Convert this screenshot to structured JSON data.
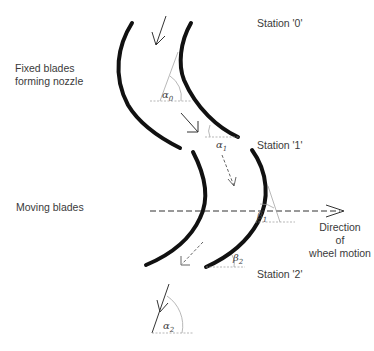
{
  "labels": {
    "fixed_blades_line1": "Fixed blades",
    "fixed_blades_line2": "forming nozzle",
    "moving_blades": "Moving blades",
    "station_0": "Station '0'",
    "station_1": "Station '1'",
    "station_2": "Station '2'",
    "direction_line1": "Direction",
    "direction_line2": "of",
    "direction_line3": "wheel motion"
  },
  "angles": {
    "alpha0": {
      "symbol": "α",
      "sub": "0"
    },
    "alpha1": {
      "symbol": "α",
      "sub": "1"
    },
    "beta1": {
      "symbol": "β",
      "sub": "1"
    },
    "beta2": {
      "symbol": "β",
      "sub": "2"
    },
    "alpha2": {
      "symbol": "α",
      "sub": "2"
    }
  },
  "colors": {
    "blade": "#111111",
    "construction": "#999999",
    "arrow": "#333333"
  }
}
